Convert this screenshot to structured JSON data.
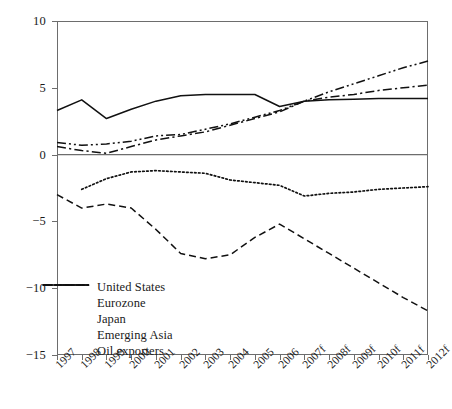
{
  "chart_data": {
    "type": "line",
    "title": "",
    "xlabel": "",
    "ylabel": "",
    "grid": false,
    "legend_position": "inside-bottom-left",
    "ylim": [
      -15,
      10
    ],
    "yticks": [
      10,
      5,
      0,
      -5,
      -10,
      -15
    ],
    "ytick_labels": [
      "10",
      "5",
      "0",
      "−5",
      "−10",
      "−15"
    ],
    "zero_line": 0,
    "categories": [
      "1997",
      "1998",
      "1999",
      "2000",
      "2001",
      "2002",
      "2003",
      "2004",
      "2005",
      "2006",
      "2007f",
      "2008f",
      "2009f",
      "2010f",
      "2011f",
      "2012f"
    ],
    "series": [
      {
        "name": "United States",
        "style": "dashed",
        "values": [
          -3.0,
          -4.0,
          -3.7,
          -4.0,
          -5.6,
          -7.4,
          -7.8,
          -7.5,
          -6.2,
          -5.2,
          -6.3,
          -7.4,
          -8.5,
          -9.6,
          -10.7,
          -11.7
        ]
      },
      {
        "name": "Eurozone",
        "style": "dotted",
        "values": [
          null,
          -2.6,
          -1.8,
          -1.3,
          -1.2,
          -1.3,
          -1.4,
          -1.9,
          -2.1,
          -2.3,
          -3.1,
          -2.9,
          -2.8,
          -2.6,
          -2.5,
          -2.4
        ]
      },
      {
        "name": "Japan",
        "style": "solid",
        "values": [
          3.3,
          4.1,
          2.7,
          3.4,
          4.0,
          4.4,
          4.5,
          4.5,
          4.5,
          3.6,
          4.0,
          4.1,
          4.15,
          4.2,
          4.2,
          4.2
        ]
      },
      {
        "name": "Emerging Asia",
        "style": "dashdotdot",
        "values": [
          0.9,
          0.7,
          0.8,
          1.0,
          1.4,
          1.5,
          1.9,
          2.3,
          2.8,
          3.3,
          4.0,
          4.7,
          5.3,
          5.9,
          6.5,
          7.0
        ]
      },
      {
        "name": "Oil exporters",
        "style": "dashdot",
        "values": [
          0.6,
          0.3,
          0.1,
          0.6,
          1.1,
          1.4,
          1.7,
          2.2,
          2.7,
          3.2,
          4.0,
          4.3,
          4.5,
          4.8,
          5.0,
          5.2
        ]
      }
    ]
  },
  "legend": {
    "items": [
      {
        "label": "United States"
      },
      {
        "label": "Eurozone"
      },
      {
        "label": "Japan"
      },
      {
        "label": "Emerging Asia"
      },
      {
        "label": "Oil exporters"
      }
    ]
  }
}
